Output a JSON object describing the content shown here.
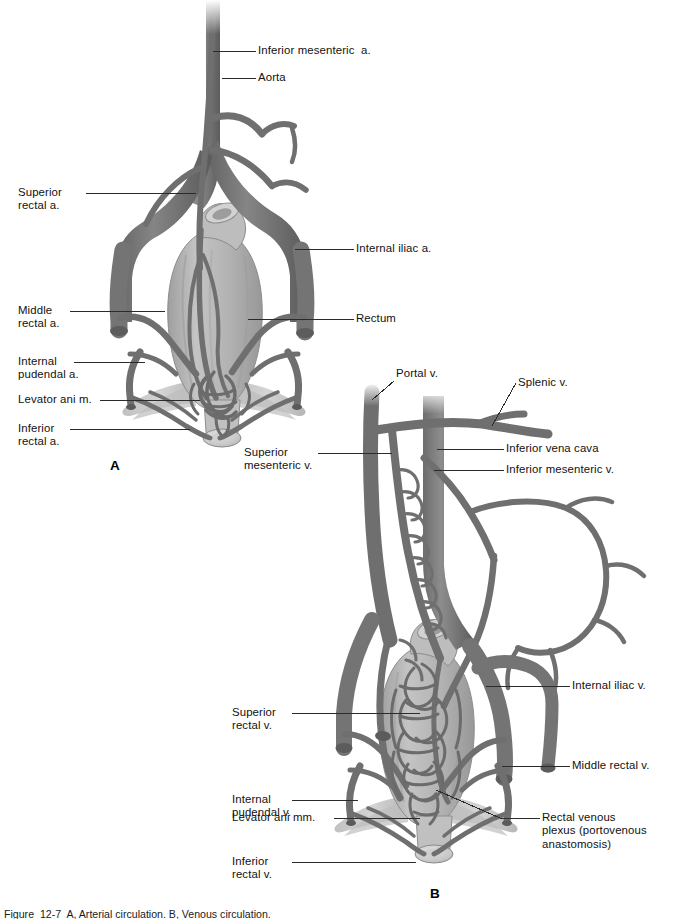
{
  "figure": {
    "title_visible": false,
    "caption": "Figure  12-7  A, Arterial circulation. B, Venous circulation.",
    "panels": [
      {
        "letter": "A",
        "name": "arterial-supply-of-rectum"
      },
      {
        "letter": "B",
        "name": "venous-drainage-of-rectum"
      }
    ]
  },
  "colors": {
    "vessel": "#7b7b7b",
    "vessel_dark": "#5d5d5d",
    "vessel_light": "#9a9a9a",
    "organ": "#b4b4b4",
    "organ_light": "#c9c9c9",
    "muscle": "#a8a8a8",
    "outline": "#4a4a4a",
    "leader": "#2b2b2b",
    "background": "#ffffff",
    "text": "#111111"
  },
  "panel_a": {
    "letter": "A",
    "labels": [
      {
        "id": "inferior-mesenteric-a",
        "text": "Inferior mesenteric  a.",
        "side": "right"
      },
      {
        "id": "aorta",
        "text": "Aorta",
        "side": "right"
      },
      {
        "id": "internal-iliac-a",
        "text": "Internal iliac a.",
        "side": "right"
      },
      {
        "id": "rectum",
        "text": "Rectum",
        "side": "right"
      },
      {
        "id": "superior-rectal-a",
        "text": "Superior\nrectal a.",
        "side": "left"
      },
      {
        "id": "middle-rectal-a",
        "text": "Middle\nrectal a.",
        "side": "left"
      },
      {
        "id": "internal-pudendal-a",
        "text": "Internal\npudendal a.",
        "side": "left"
      },
      {
        "id": "levator-ani-m",
        "text": "Levator ani m.",
        "side": "left"
      },
      {
        "id": "inferior-rectal-a",
        "text": "Inferior\nrectal a.",
        "side": "left"
      }
    ]
  },
  "panel_b": {
    "letter": "B",
    "labels": [
      {
        "id": "portal-v",
        "text": "Portal v.",
        "side": "top"
      },
      {
        "id": "splenic-v",
        "text": "Splenic v.",
        "side": "top"
      },
      {
        "id": "inferior-vena-cava",
        "text": "Inferior vena cava",
        "side": "right"
      },
      {
        "id": "inferior-mesenteric-v",
        "text": "Inferior mesenteric v.",
        "side": "right"
      },
      {
        "id": "superior-mesenteric-v",
        "text": "Superior\nmesenteric v.",
        "side": "left"
      },
      {
        "id": "internal-iliac-v",
        "text": "Internal iliac v.",
        "side": "right"
      },
      {
        "id": "superior-rectal-v",
        "text": "Superior\nrectal v.",
        "side": "left"
      },
      {
        "id": "middle-rectal-v",
        "text": "Middle rectal v.",
        "side": "right"
      },
      {
        "id": "internal-pudendal-v",
        "text": "Internal\npudendal v.",
        "side": "left"
      },
      {
        "id": "levator-ani-mm",
        "text": "Levator ani mm.",
        "side": "left"
      },
      {
        "id": "rectal-venous-plexus",
        "text": "Rectal venous\nplexus (portovenous\nanastomosis)",
        "side": "right"
      },
      {
        "id": "inferior-rectal-v",
        "text": "Inferior\nrectal v.",
        "side": "left"
      }
    ]
  }
}
